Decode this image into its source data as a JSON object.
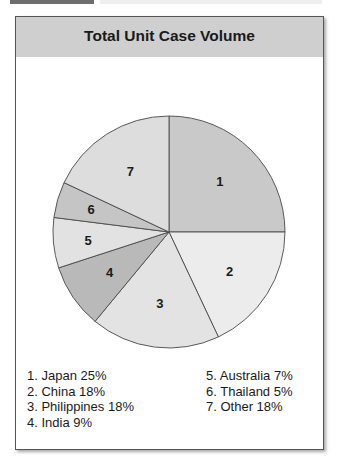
{
  "title": "Total Unit Case Volume",
  "chart_data": {
    "type": "pie",
    "title": "Total Unit Case Volume",
    "categories": [
      "Japan",
      "China",
      "Philippines",
      "India",
      "Australia",
      "Thailand",
      "Other"
    ],
    "values": [
      25,
      18,
      18,
      9,
      7,
      5,
      18
    ],
    "slice_labels": [
      "1",
      "2",
      "3",
      "4",
      "5",
      "6",
      "7"
    ],
    "start_angle": "12 o'clock, clockwise",
    "colors": [
      "#c9c9c9",
      "#ececec",
      "#e3e3e3",
      "#b9b9b9",
      "#e2e2e2",
      "#c5c5c5",
      "#dddddd"
    ],
    "legend_position": "bottom"
  },
  "legend": {
    "col1": [
      "1. Japan 25%",
      "2. China 18%",
      "3. Philippines 18%",
      "4. India 9%"
    ],
    "col2": [
      "5. Australia 7%",
      "6. Thailand 5%",
      "7. Other 18%"
    ]
  }
}
